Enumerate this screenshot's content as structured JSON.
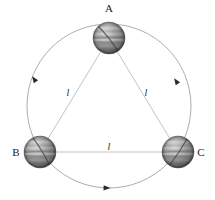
{
  "figure": {
    "canvas": {
      "width": 215,
      "height": 200,
      "background": "#ffffff"
    },
    "colors": {
      "orbit_stroke": "#8a8a8a",
      "triangle_stroke": "#b0b0b0",
      "arrow_fill": "#2a2a2a",
      "label_color": "#1a1a1a",
      "body_light": "#e8e8e8",
      "body_mid": "#9a9a9a",
      "body_dark": "#4a4a4a",
      "body_edge": "#3a3a3a"
    }
  },
  "orbit": {
    "name": "circular-orbit",
    "center_x": 109,
    "center_y": 106,
    "radius": 82,
    "stroke_width": 0.7,
    "direction": "counterclockwise"
  },
  "bodies": [
    {
      "id": "A",
      "label": "A",
      "cx": 109,
      "cy": 38,
      "r": 16,
      "label_x": 109,
      "label_y": 12,
      "label_anchor": "middle"
    },
    {
      "id": "B",
      "label": "B",
      "cx": 40,
      "cy": 152,
      "r": 16,
      "label_x": 16,
      "label_y": 156,
      "label_anchor": "middle"
    },
    {
      "id": "C",
      "label": "C",
      "cx": 178,
      "cy": 152,
      "r": 16,
      "label_x": 201,
      "label_y": 156,
      "label_anchor": "middle"
    }
  ],
  "sides": [
    {
      "id": "AB",
      "label": "l",
      "x1": 109,
      "y1": 38,
      "x2": 40,
      "y2": 152,
      "label_x": 68,
      "label_y": 96
    },
    {
      "id": "AC",
      "label": "l",
      "x1": 109,
      "y1": 38,
      "x2": 178,
      "y2": 152,
      "label_x": 146,
      "label_y": 96
    },
    {
      "id": "BC",
      "label": "l",
      "x1": 40,
      "y1": 152,
      "x2": 178,
      "y2": 152,
      "label_x": 109,
      "label_y": 150
    }
  ],
  "orbit_arrows": [
    {
      "id": "arrow-upper-left",
      "angle_deg": 145,
      "x": 34,
      "y": 79,
      "rotation": -55
    },
    {
      "id": "arrow-upper-right",
      "angle_deg": 35,
      "x": 176,
      "y": 81,
      "rotation": 57
    },
    {
      "id": "arrow-bottom",
      "angle_deg": 268,
      "x": 107,
      "y": 188,
      "rotation": 2
    }
  ]
}
